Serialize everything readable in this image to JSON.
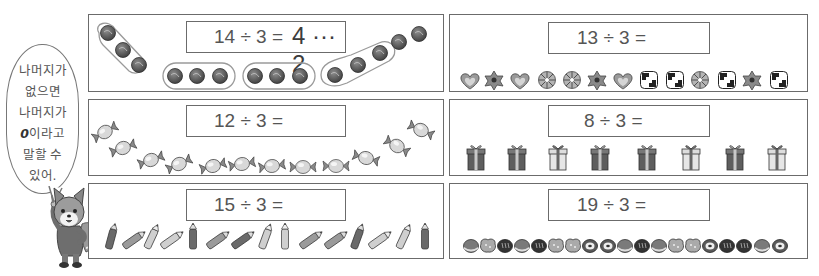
{
  "speech_bubble": {
    "lines": [
      "나머지가",
      "없으면",
      "나머지가",
      "0이라고",
      "말할 수",
      "있어."
    ],
    "bold_prefix_line_index": 3,
    "bold_prefix": "0",
    "line3_rest": "이라고"
  },
  "character": {
    "name": "fox",
    "description": "fox character pointing up"
  },
  "panels": [
    {
      "id": "p1",
      "equation": "14 ÷ 3 =",
      "answer": "4 ··· 2",
      "item": "round candy",
      "count": 14,
      "grouped": true,
      "groups": 4,
      "remainder": 2
    },
    {
      "id": "p2",
      "equation": "13 ÷ 3 =",
      "answer": "",
      "item": "cookies",
      "count": 13
    },
    {
      "id": "p3",
      "equation": "12 ÷ 3 =",
      "answer": "",
      "item": "wrapped candy",
      "count": 12
    },
    {
      "id": "p4",
      "equation": "8 ÷ 3 =",
      "answer": "",
      "item": "gift box",
      "count": 8
    },
    {
      "id": "p5",
      "equation": "15 ÷ 3 =",
      "answer": "",
      "item": "pencil",
      "count": 15
    },
    {
      "id": "p6",
      "equation": "19 ÷ 3 =",
      "answer": "",
      "item": "bread",
      "count": 19
    }
  ],
  "colors": {
    "border": "#6b6b6b",
    "dark": "#4a4a4a",
    "mid": "#8a8a8a",
    "light": "#cfcfcf"
  }
}
